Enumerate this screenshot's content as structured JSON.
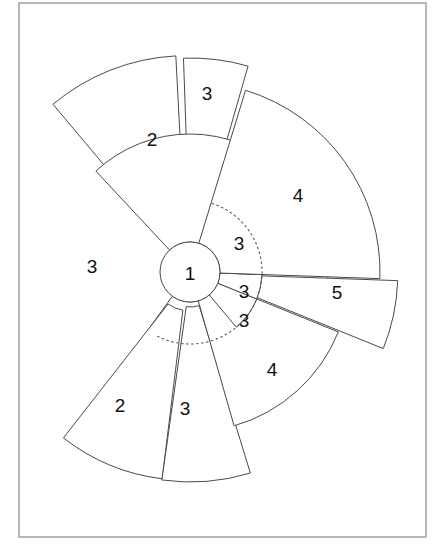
{
  "figure": {
    "background_color": "#ffffff",
    "frame_color": "#9a9a9a",
    "stroke_color": "#4a4a4a",
    "label_color": "#111111",
    "guide_arc_style": "dotted"
  },
  "hub": {
    "label": "1",
    "center_x": 190,
    "center_y": 272,
    "radius": 30
  },
  "guide_arc": {
    "radius": 72,
    "start_deg": -72,
    "end_deg": 118
  },
  "sectors": [
    {
      "id": "sector-top-3",
      "label": "3",
      "label_x": 207,
      "label_y": 93,
      "start_deg": -92,
      "end_deg": -74,
      "outer_radius": 208,
      "explode": 6
    },
    {
      "id": "sector-upper-left-2",
      "label": "2",
      "label_x": 152,
      "label_y": 139,
      "start_deg": -130,
      "end_deg": -93,
      "outer_radius": 208,
      "explode": 9
    },
    {
      "id": "sector-left-3",
      "label": "3",
      "label_x": 92,
      "label_y": 266,
      "start_deg": -133,
      "end_deg": 126,
      "outer_radius": 138,
      "explode": 0
    },
    {
      "id": "sector-lower-left-2",
      "label": "2",
      "label_x": 120,
      "label_y": 405,
      "start_deg": 97,
      "end_deg": 128,
      "outer_radius": 200,
      "explode": 9
    },
    {
      "id": "sector-lower-3",
      "label": "3",
      "label_x": 185,
      "label_y": 408,
      "start_deg": 73,
      "end_deg": 98,
      "outer_radius": 205,
      "explode": 5
    },
    {
      "id": "sector-lower-right-4",
      "label": "4",
      "label_x": 272,
      "label_y": 369,
      "start_deg": 22,
      "end_deg": 74,
      "outer_radius": 160,
      "explode": 0
    },
    {
      "id": "sector-right-5",
      "label": "5",
      "label_x": 337,
      "label_y": 292,
      "start_deg": 2,
      "end_deg": 22,
      "outer_radius": 200,
      "explode": 8
    },
    {
      "id": "sector-inner-3-lower",
      "label": "3",
      "label_x": 244,
      "label_y": 320,
      "start_deg": 22,
      "end_deg": 50,
      "outer_radius": 72,
      "explode": 0
    },
    {
      "id": "sector-inner-3-mid",
      "label": "3",
      "label_x": 244,
      "label_y": 291,
      "start_deg": 2,
      "end_deg": 22,
      "outer_radius": 72,
      "explode": 0
    },
    {
      "id": "sector-inner-3-upper",
      "label": "3",
      "label_x": 239,
      "label_y": 243,
      "start_deg": -72,
      "end_deg": 2,
      "outer_radius": 72,
      "explode": 0
    },
    {
      "id": "sector-upper-right-4",
      "label": "4",
      "label_x": 298,
      "label_y": 195,
      "start_deg": -73,
      "end_deg": 2,
      "outer_radius": 190,
      "explode": 0
    }
  ],
  "frame": {
    "x": 19,
    "y": 3,
    "width": 407,
    "height": 534
  }
}
